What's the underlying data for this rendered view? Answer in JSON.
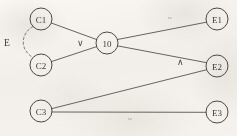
{
  "diagram": {
    "background_color": "#f8f6f3",
    "stroke_color": "#55544f",
    "text_color": "#3a3a38",
    "nodes": [
      {
        "id": "C1",
        "label": "C1",
        "x": 41,
        "y": 19,
        "r": 11
      },
      {
        "id": "C2",
        "label": "C2",
        "x": 41,
        "y": 65,
        "r": 11
      },
      {
        "id": "C3",
        "label": "C3",
        "x": 41,
        "y": 111,
        "r": 11
      },
      {
        "id": "IO",
        "label": "10",
        "x": 107,
        "y": 43,
        "r": 11
      },
      {
        "id": "E1",
        "label": "E1",
        "x": 217,
        "y": 19,
        "r": 11
      },
      {
        "id": "E2",
        "label": "E2",
        "x": 217,
        "y": 66,
        "r": 11
      },
      {
        "id": "E3",
        "label": "E3",
        "x": 217,
        "y": 112,
        "r": 11
      }
    ],
    "edges": [
      {
        "id": "c1-io",
        "from": "C1",
        "to": "IO",
        "style": "solid"
      },
      {
        "id": "c2-io",
        "from": "C2",
        "to": "IO",
        "style": "solid"
      },
      {
        "id": "io-e1",
        "from": "IO",
        "to": "E1",
        "style": "solid"
      },
      {
        "id": "io-e2",
        "from": "IO",
        "to": "E2",
        "style": "solid"
      },
      {
        "id": "c3-e2",
        "from": "C3",
        "to": "E2",
        "style": "solid"
      },
      {
        "id": "c3-e3",
        "from": "C3",
        "to": "E3",
        "style": "solid"
      },
      {
        "id": "c1-c2",
        "from": "C1",
        "to": "C2",
        "style": "dashed"
      }
    ],
    "edge_labels": [
      {
        "id": "or-label",
        "text": "∨",
        "x": 80,
        "y": 43,
        "emphasis": "normal"
      },
      {
        "id": "and-label",
        "text": "∧",
        "x": 180,
        "y": 62,
        "emphasis": "normal"
      },
      {
        "id": "tilde-top-label",
        "text": "~",
        "x": 170,
        "y": 18,
        "emphasis": "faint"
      },
      {
        "id": "tilde-bottom-label",
        "text": "~",
        "x": 130,
        "y": 119,
        "emphasis": "faint"
      }
    ],
    "group_labels": [
      {
        "id": "e-group-label",
        "text": "E",
        "x": 7,
        "y": 43
      }
    ]
  }
}
